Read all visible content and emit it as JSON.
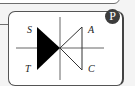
{
  "card": {
    "badge_label": "P",
    "symbol": "bidirectional-triangle-switch",
    "labels": {
      "top_left": "S",
      "bottom_left": "T",
      "top_right": "A",
      "bottom_right": "C"
    }
  },
  "colors": {
    "badge_bg": "#3d3d3d",
    "fill_triangle": "#000000",
    "line": "#555555",
    "background": "#f4f4f4"
  }
}
